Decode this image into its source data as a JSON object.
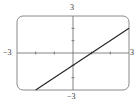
{
  "chart_data": {
    "type": "line",
    "title": "",
    "xlabel": "",
    "ylabel": "",
    "xlim": [
      -3,
      3
    ],
    "ylim": [
      -3,
      3
    ],
    "grid": false,
    "axes_ticks": {
      "x": [
        -2,
        -1,
        1,
        2
      ],
      "y": [
        -2,
        -1,
        1,
        2
      ]
    },
    "tick_labels": {
      "x_min": "−3",
      "x_max": "3",
      "y_max": "3",
      "y_min": "−3"
    },
    "series": [
      {
        "name": "y = x − 1",
        "slope": 1,
        "intercept": -1,
        "x": [
          -2,
          3
        ],
        "y": [
          -3,
          2
        ]
      }
    ]
  },
  "colors": {
    "frame": "#888888",
    "axes": "#666666",
    "line": "#222222",
    "background": "#ffffff"
  }
}
